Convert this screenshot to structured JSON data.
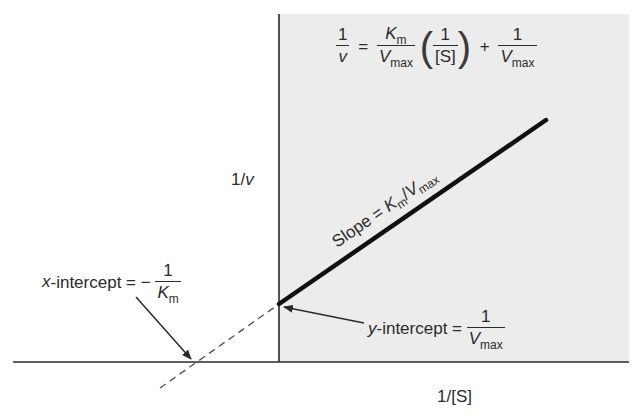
{
  "colors": {
    "plot_background": "#ececec",
    "axis": "#2a2a2a",
    "line": "#111111",
    "dashed": "#555555"
  },
  "equation": {
    "lhs_num": "1",
    "lhs_den": "v",
    "equals": "=",
    "slope_num_main": "K",
    "slope_num_sub": "m",
    "slope_den_main": "V",
    "slope_den_sub": "max",
    "paren_open": "(",
    "s_num": "1",
    "s_den": "[S]",
    "paren_close": ")",
    "plus": "+",
    "int_num": "1",
    "int_den_main": "V",
    "int_den_sub": "max"
  },
  "axes": {
    "y_label_num": "1/",
    "y_label_var": "v",
    "x_label": "1/[S]"
  },
  "annotations": {
    "slope": {
      "prefix": "Slope = ",
      "k": "K",
      "k_sub": "m",
      "slash": "/",
      "v": "V",
      "v_sub": "max"
    },
    "x_intercept": {
      "var": "x",
      "text": "-intercept = −",
      "num": "1",
      "den_main": "K",
      "den_sub": "m"
    },
    "y_intercept": {
      "var": "y",
      "text": "-intercept = ",
      "num": "1",
      "den_main": "V",
      "den_sub": "max"
    }
  },
  "geometry": {
    "y_axis_x": 279,
    "x_axis_y": 362,
    "y_intercept_point": [
      279,
      304
    ],
    "x_intercept_point": [
      194,
      362
    ],
    "line_end_point": [
      546,
      120
    ]
  }
}
